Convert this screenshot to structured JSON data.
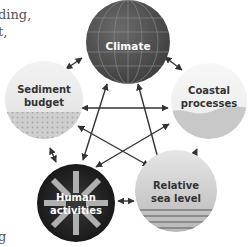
{
  "side_text": {
    "line1": "ding,",
    "line2": "t,",
    "line3": "g"
  },
  "nodes": {
    "climate": {
      "label": "Climate",
      "fill": "#5a5a5a",
      "text_color": "#ffffff"
    },
    "sediment": {
      "label_line1": "Sediment",
      "label_line2": "budget",
      "fill": "#e6e6e6",
      "text_color": "#333333"
    },
    "coastal": {
      "label_line1": "Coastal",
      "label_line2": "processes",
      "fill": "#f0f0f0",
      "text_color": "#333333"
    },
    "human": {
      "label_line1": "Human",
      "label_line2": "activities",
      "fill": "#2e2e2e",
      "text_color": "#ffffff"
    },
    "sea": {
      "label_line1": "Relative",
      "label_line2": "sea level",
      "fill": "#d4d4d4",
      "text_color": "#333333"
    }
  },
  "colors": {
    "arrow": "#333333"
  }
}
